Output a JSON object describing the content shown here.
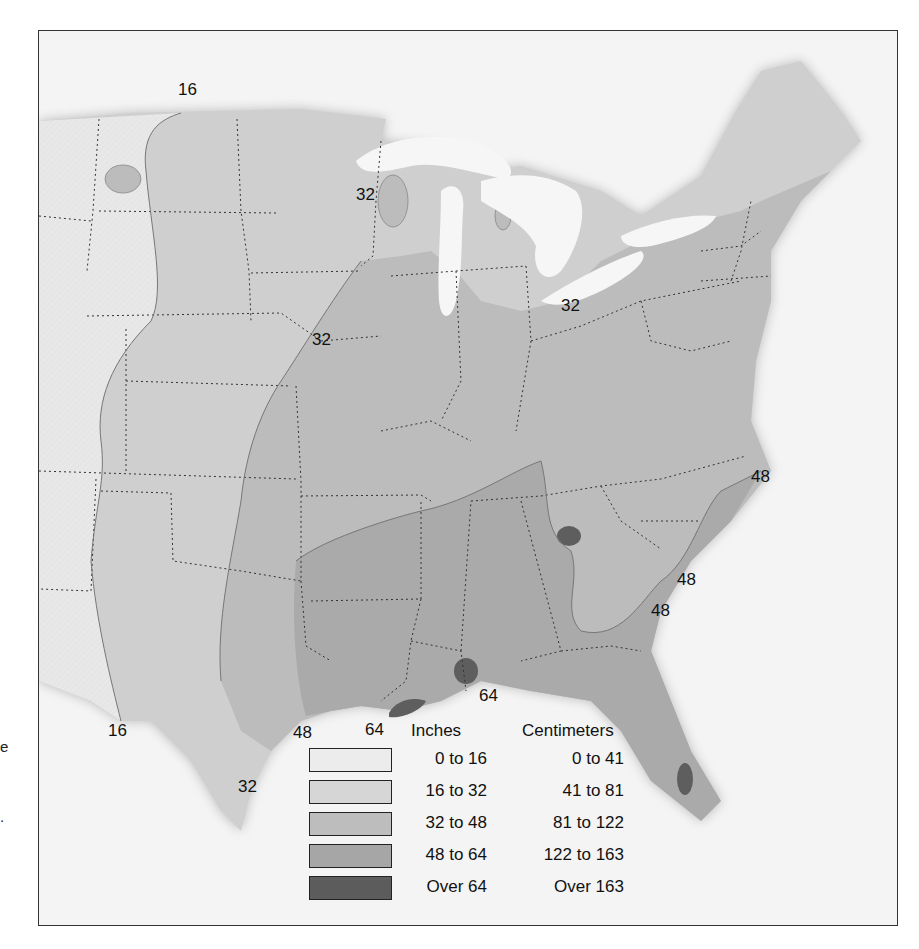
{
  "side_text": {
    "frag_1": "e",
    "frag_2": "."
  },
  "map": {
    "subject": "Annual precipitation, contiguous eastern United States",
    "contour_labels": [
      {
        "id": "north-16",
        "text": "16",
        "x": 177,
        "y": 80
      },
      {
        "id": "wisconsin-32",
        "text": "32",
        "x": 355,
        "y": 185
      },
      {
        "id": "lake-erie-32",
        "text": "32",
        "x": 560,
        "y": 296
      },
      {
        "id": "iowa-32",
        "text": "32",
        "x": 311,
        "y": 330
      },
      {
        "id": "nc-coast-48",
        "text": "48",
        "x": 750,
        "y": 467
      },
      {
        "id": "sc-coast-48-upper",
        "text": "48",
        "x": 676,
        "y": 570
      },
      {
        "id": "sc-coast-48-lower",
        "text": "48",
        "x": 650,
        "y": 601
      },
      {
        "id": "gulf-64-al",
        "text": "64",
        "x": 478,
        "y": 686
      },
      {
        "id": "gulf-64-la",
        "text": "64",
        "x": 364,
        "y": 720
      },
      {
        "id": "gulf-48-tx",
        "text": "48",
        "x": 292,
        "y": 723
      },
      {
        "id": "texas-16",
        "text": "16",
        "x": 107,
        "y": 721
      },
      {
        "id": "texas-32",
        "text": "32",
        "x": 237,
        "y": 777
      }
    ]
  },
  "legend": {
    "inches_header": "Inches",
    "cm_header": "Centimeters",
    "rows": [
      {
        "inches": "0 to 16",
        "cm": "0 to 41",
        "color": "#ececec"
      },
      {
        "inches": "16 to 32",
        "cm": "41 to 81",
        "color": "#d6d6d6"
      },
      {
        "inches": "32 to 48",
        "cm": "81 to 122",
        "color": "#bdbdbd"
      },
      {
        "inches": "48 to 64",
        "cm": "122 to 163",
        "color": "#a6a6a6"
      },
      {
        "inches": "Over 64",
        "cm": "Over 163",
        "color": "#5c5c5c"
      }
    ]
  },
  "colors": {
    "water": "#f4f4f4",
    "band_0_16": "#e4e4e4",
    "band_16_32": "#cfcfcf",
    "band_32_48": "#bcbcbc",
    "band_48_64": "#a9a9a9",
    "band_over_64": "#5e5e5e",
    "frame": "#333333"
  }
}
